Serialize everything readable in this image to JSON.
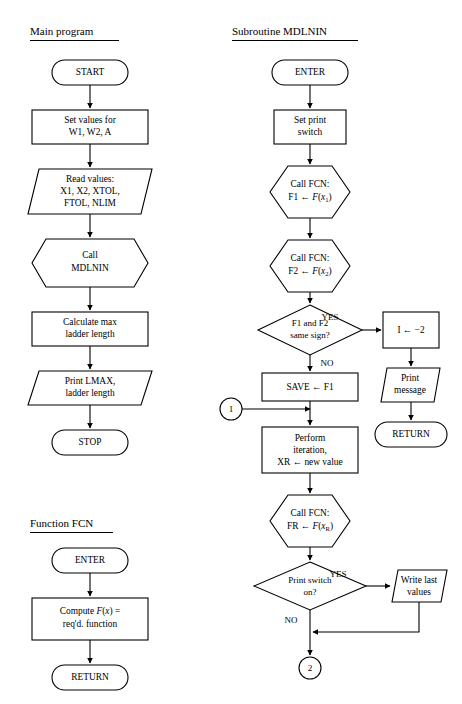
{
  "figure": {
    "type": "flowchart",
    "columns": [
      {
        "id": "main-program",
        "title": "Main program",
        "nodes": [
          {
            "id": "start",
            "shape": "terminator",
            "lines": [
              "START"
            ]
          },
          {
            "id": "set-values",
            "shape": "process",
            "lines": [
              "Set values for",
              "W1, W2, A"
            ]
          },
          {
            "id": "read-values",
            "shape": "io",
            "lines": [
              "Read values:",
              "X1, X2, XTOL,",
              "FTOL, NLIM"
            ]
          },
          {
            "id": "call-mdlnin",
            "shape": "subroutine",
            "lines": [
              "Call",
              "MDLNIN"
            ]
          },
          {
            "id": "calc-max",
            "shape": "process",
            "lines": [
              "Calculate max",
              "ladder length"
            ]
          },
          {
            "id": "print-lmax",
            "shape": "io",
            "lines": [
              "Print LMAX,",
              "ladder length"
            ]
          },
          {
            "id": "stop",
            "shape": "terminator",
            "lines": [
              "STOP"
            ]
          }
        ]
      },
      {
        "id": "function-fcn",
        "title": "Function FCN",
        "nodes": [
          {
            "id": "fcn-enter",
            "shape": "terminator",
            "lines": [
              "ENTER"
            ]
          },
          {
            "id": "fcn-compute",
            "shape": "process",
            "lines": [
              "Compute F(x) =",
              "req'd. function"
            ]
          },
          {
            "id": "fcn-return",
            "shape": "terminator",
            "lines": [
              "RETURN"
            ]
          }
        ]
      },
      {
        "id": "subroutine-mdlnin",
        "title": "Subroutine MDLNIN",
        "nodes": [
          {
            "id": "sub-enter",
            "shape": "terminator",
            "lines": [
              "ENTER"
            ]
          },
          {
            "id": "set-print",
            "shape": "process",
            "lines": [
              "Set print",
              "switch"
            ]
          },
          {
            "id": "call-fcn-1",
            "shape": "subroutine",
            "lines": [
              "Call FCN:",
              "F1 ← F(x1)"
            ]
          },
          {
            "id": "call-fcn-2",
            "shape": "subroutine",
            "lines": [
              "Call FCN:",
              "F2 ← F(x2)"
            ]
          },
          {
            "id": "same-sign",
            "shape": "decision",
            "lines": [
              "F1 and F2",
              "same sign?"
            ]
          },
          {
            "id": "set-i",
            "shape": "process",
            "lines": [
              "I ← −2"
            ]
          },
          {
            "id": "print-message",
            "shape": "io",
            "lines": [
              "Print",
              "message"
            ]
          },
          {
            "id": "sub-return",
            "shape": "terminator",
            "lines": [
              "RETURN"
            ]
          },
          {
            "id": "save-f1",
            "shape": "process",
            "lines": [
              "SAVE ← F1"
            ]
          },
          {
            "id": "connector-1",
            "shape": "connector",
            "lines": [
              "1"
            ]
          },
          {
            "id": "perform-iter",
            "shape": "process",
            "lines": [
              "Perform",
              "iteration,",
              "XR ← new value"
            ]
          },
          {
            "id": "call-fcn-r",
            "shape": "subroutine",
            "lines": [
              "Call FCN:",
              "FR ← F(xR)"
            ]
          },
          {
            "id": "print-switch",
            "shape": "decision",
            "lines": [
              "Print switch",
              "on?"
            ]
          },
          {
            "id": "write-last",
            "shape": "io",
            "lines": [
              "Write last",
              "values"
            ]
          },
          {
            "id": "connector-2",
            "shape": "connector",
            "lines": [
              "2"
            ]
          }
        ]
      }
    ],
    "branch_labels": {
      "same_sign_yes": "YES",
      "same_sign_no": "NO",
      "print_switch_yes": "YES",
      "print_switch_no": "NO"
    },
    "colors": {
      "stroke": "#000000",
      "fill": "#ffffff",
      "text": "#000000"
    }
  }
}
